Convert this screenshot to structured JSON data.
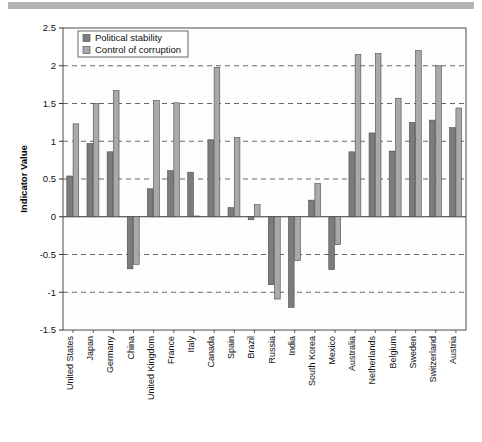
{
  "chart_data": {
    "type": "bar",
    "title": "",
    "xlabel": "",
    "ylabel": "Indicator Value",
    "ylim": [
      -1.5,
      2.5
    ],
    "ytick_step": 0.5,
    "yticks": [
      "2.5",
      "2",
      "1.5",
      "1",
      "0.5",
      "0",
      "-0.5",
      "-1",
      "-1.5"
    ],
    "ytick_values": [
      2.5,
      2,
      1.5,
      1,
      0.5,
      0,
      -0.5,
      -1,
      -1.5
    ],
    "grid": true,
    "grid_style": "dashed-horizontal",
    "legend_position": "top-left-inside",
    "categories": [
      "United States",
      "Japan",
      "Germany",
      "China",
      "United Kingdom",
      "France",
      "Italy",
      "Canada",
      "Spain",
      "Brazil",
      "Russia",
      "India",
      "South Korea",
      "Mexico",
      "Australia",
      "Netherlands",
      "Belgium",
      "Sweden",
      "Switzerland",
      "Austria"
    ],
    "series": [
      {
        "name": "Political stability",
        "color": "#7c7c7c",
        "values": [
          0.54,
          0.97,
          0.86,
          -0.69,
          0.37,
          0.61,
          0.59,
          1.02,
          0.12,
          -0.04,
          -0.9,
          -1.2,
          0.22,
          -0.7,
          0.86,
          1.11,
          0.87,
          1.25,
          1.28,
          1.18
        ]
      },
      {
        "name": "Control of corruption",
        "color": "#a9a9a9",
        "values": [
          1.23,
          1.5,
          1.67,
          -0.63,
          1.54,
          1.51,
          0.01,
          1.98,
          1.05,
          0.16,
          -1.09,
          -0.58,
          0.44,
          -0.37,
          2.15,
          2.16,
          1.57,
          2.2,
          2.0,
          1.44
        ]
      }
    ]
  },
  "legend": {
    "items": [
      {
        "label": "Political stability",
        "swatch": "#7c7c7c"
      },
      {
        "label": "Control of corruption",
        "swatch": "#a9a9a9"
      }
    ]
  },
  "axes": {
    "y_title": "Indicator Value"
  },
  "colors": {
    "series_political": "#7c7c7c",
    "series_corruption": "#a9a9a9",
    "grid": "#555555",
    "frame": "#4d4d4d",
    "band": "#b3b3b3",
    "background": "#ffffff"
  }
}
